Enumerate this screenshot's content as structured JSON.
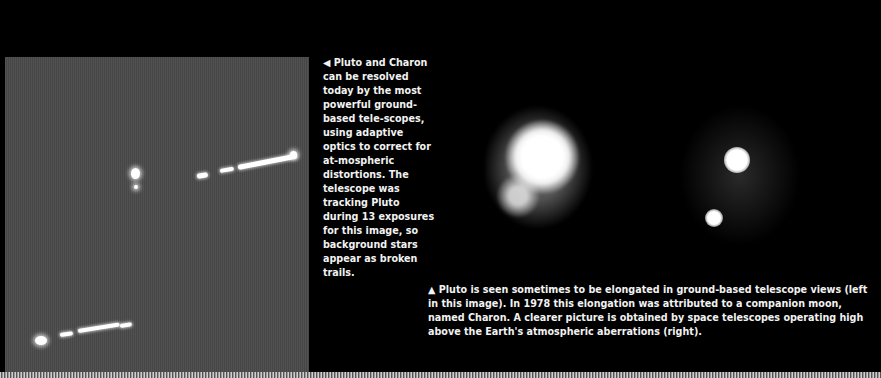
{
  "left_photo": {
    "description": "Ground-based adaptive optics image of Pluto and Charon with broken star trails"
  },
  "side_caption": {
    "icon": "triangle-left-icon",
    "glyph": "◀",
    "text": "Pluto and Charon can be resolved today by the most powerful ground-based tele-scopes, using adaptive optics to correct for at-mospheric distortions. The telescope was tracking Pluto during 13 exposures for this image, so background stars appear as broken trails."
  },
  "right_photos": {
    "left_label": "ground-based telescope view",
    "right_label": "space telescope view"
  },
  "bottom_caption": {
    "icon": "triangle-up-icon",
    "glyph": "▲",
    "text": "Pluto is seen sometimes to be elongated in ground-based telescope views (left in this image). In 1978 this elongation was attributed to a companion moon, named Charon. A clearer picture is obtained by space telescopes operating high above the Earth's atmospheric aberrations (right)."
  }
}
